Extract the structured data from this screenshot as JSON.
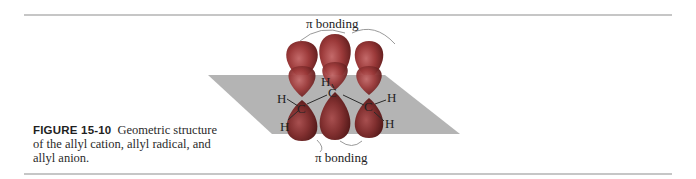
{
  "figure": {
    "label": "FIGURE 15-10",
    "caption": "Geometric structure of the allyl cation, allyl radical, and allyl anion.",
    "annotations": {
      "top": "π bonding",
      "bottom": "π bonding"
    },
    "atoms": {
      "carbon": "C",
      "hydrogen": "H"
    },
    "colors": {
      "plane": "#b4b4b4",
      "orbital": "#9c3a3a",
      "rule": "#c6c6c6"
    }
  }
}
